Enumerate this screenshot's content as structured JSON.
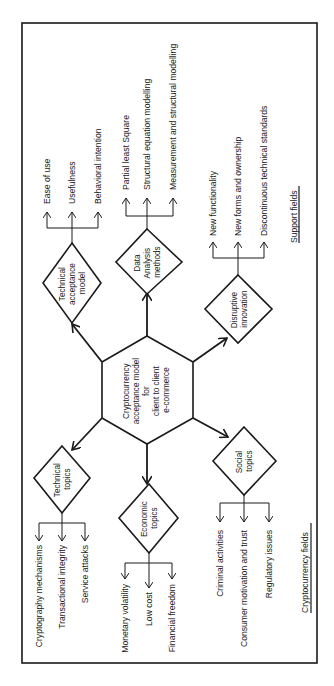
{
  "diagram": {
    "center": {
      "lines": [
        "Cryptocurrency",
        "acceptance model",
        "for",
        "client to client",
        "e-commerce"
      ]
    },
    "support_fields": {
      "title": "Support fields",
      "nodes": [
        {
          "id": "technical-acceptance-model",
          "lines": [
            "Technical",
            "acceptance",
            "model"
          ],
          "children": [
            "Ease of use",
            "Usefulness",
            "Behavioral intention"
          ]
        },
        {
          "id": "data-analysis-methods",
          "lines": [
            "Data",
            "Analysis",
            "methods"
          ],
          "children": [
            "Partial least Square",
            "Structural equation modelling",
            "Measurement and structural modelling"
          ]
        },
        {
          "id": "disruptive-innovation",
          "lines": [
            "Disruptive",
            "innovation"
          ],
          "children": [
            "New functionality",
            "New forms and ownership",
            "Discontinuous technical standards"
          ]
        }
      ]
    },
    "cryptocurrency_fields": {
      "title": "Cryptocurrency fields",
      "nodes": [
        {
          "id": "technical-topics",
          "lines": [
            "Technical",
            "topics"
          ],
          "children": [
            "Cryptography mechanisms",
            "Transactional integrity",
            "Service attacks"
          ]
        },
        {
          "id": "economic-topics",
          "lines": [
            "Economic",
            "topics"
          ],
          "children": [
            "Monetary volatility",
            "Low cost",
            "Financial freedom"
          ]
        },
        {
          "id": "social-topics",
          "lines": [
            "Social",
            "topics"
          ],
          "children": [
            "Criminal activities",
            "Consumer motivation and trust",
            "Regulatory issues"
          ]
        }
      ]
    }
  }
}
